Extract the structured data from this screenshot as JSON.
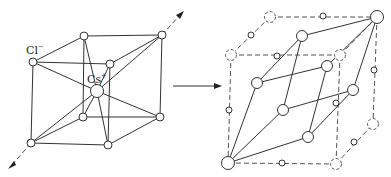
{
  "left_structure": {
    "name": "CsCl unit cell",
    "labels": {
      "anion": "Cl",
      "anion_charge": "−",
      "cation": "Cs",
      "cation_charge": "+"
    }
  },
  "transform_arrow": {
    "direction": "right"
  },
  "right_structure": {
    "name": "rhombohedral cell within dashed cubic cell"
  },
  "colors": {
    "line": "#333333",
    "background": "#ffffff"
  }
}
